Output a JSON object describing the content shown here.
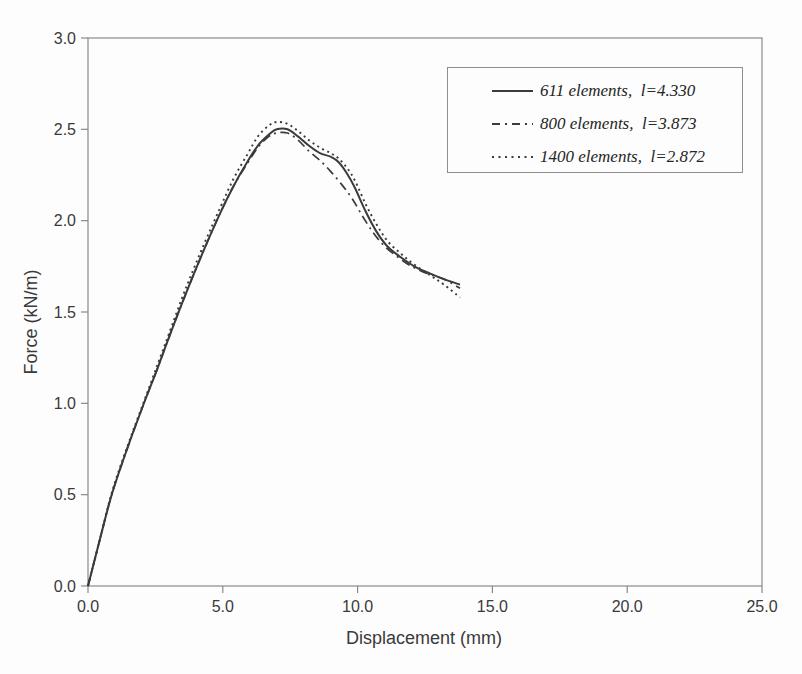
{
  "figure": {
    "background": "#fdfdfd",
    "ink_color": "#3b3b3b",
    "frame_color": "#8a8a8a",
    "text_color": "#3a3a3a"
  },
  "chart_data": {
    "type": "line",
    "title": "",
    "xlabel": "Displacement (mm)",
    "ylabel": "Force (kN/m)",
    "xlim": [
      0,
      25
    ],
    "ylim": [
      0,
      3
    ],
    "x_ticks": [
      0,
      5,
      10,
      15,
      20,
      25
    ],
    "x_tick_labels": [
      "0.0",
      "5.0",
      "10.0",
      "15.0",
      "20.0",
      "25.0"
    ],
    "y_ticks": [
      0,
      0.5,
      1,
      1.5,
      2,
      2.5,
      3
    ],
    "y_tick_labels": [
      "0.0",
      "0.5",
      "1.0",
      "1.5",
      "2.0",
      "2.5",
      "3.0"
    ],
    "grid": false,
    "legend_position": "top-right",
    "series": [
      {
        "name": "611 elements,  l=4.330",
        "line_style": "solid",
        "color": "#3b3b3b",
        "points": [
          [
            0,
            0
          ],
          [
            0.45,
            0.26
          ],
          [
            0.9,
            0.51
          ],
          [
            1.5,
            0.77
          ],
          [
            2.1,
            1.01
          ],
          [
            2.6,
            1.2
          ],
          [
            3.0,
            1.36
          ],
          [
            3.6,
            1.59
          ],
          [
            4.3,
            1.84
          ],
          [
            4.9,
            2.04
          ],
          [
            5.4,
            2.19
          ],
          [
            5.9,
            2.32
          ],
          [
            6.3,
            2.41
          ],
          [
            6.7,
            2.47
          ],
          [
            7.0,
            2.5
          ],
          [
            7.4,
            2.5
          ],
          [
            7.8,
            2.46
          ],
          [
            8.2,
            2.41
          ],
          [
            8.6,
            2.37
          ],
          [
            9.0,
            2.35
          ],
          [
            9.3,
            2.32
          ],
          [
            9.6,
            2.26
          ],
          [
            9.9,
            2.18
          ],
          [
            10.3,
            2.05
          ],
          [
            10.7,
            1.94
          ],
          [
            11.1,
            1.86
          ],
          [
            11.6,
            1.8
          ],
          [
            12.1,
            1.75
          ],
          [
            12.7,
            1.71
          ],
          [
            13.2,
            1.68
          ],
          [
            13.8,
            1.65
          ]
        ]
      },
      {
        "name": "800 elements,  l=3.873",
        "line_style": "dash-dot",
        "color": "#3b3b3b",
        "points": [
          [
            0,
            0
          ],
          [
            0.45,
            0.26
          ],
          [
            0.9,
            0.51
          ],
          [
            1.5,
            0.77
          ],
          [
            2.1,
            1.01
          ],
          [
            2.6,
            1.2
          ],
          [
            3.0,
            1.36
          ],
          [
            3.6,
            1.59
          ],
          [
            4.3,
            1.84
          ],
          [
            4.9,
            2.04
          ],
          [
            5.4,
            2.19
          ],
          [
            5.9,
            2.31
          ],
          [
            6.3,
            2.4
          ],
          [
            6.7,
            2.46
          ],
          [
            7.0,
            2.48
          ],
          [
            7.4,
            2.48
          ],
          [
            7.8,
            2.44
          ],
          [
            8.2,
            2.38
          ],
          [
            8.6,
            2.33
          ],
          [
            9.0,
            2.27
          ],
          [
            9.4,
            2.2
          ],
          [
            9.8,
            2.12
          ],
          [
            10.2,
            2.02
          ],
          [
            10.6,
            1.93
          ],
          [
            11.0,
            1.86
          ],
          [
            11.5,
            1.8
          ],
          [
            12.0,
            1.75
          ],
          [
            12.6,
            1.71
          ],
          [
            13.2,
            1.68
          ],
          [
            13.8,
            1.63
          ]
        ]
      },
      {
        "name": "1400 elements,  l=2.872",
        "line_style": "dotted",
        "color": "#3b3b3b",
        "points": [
          [
            0,
            0
          ],
          [
            0.45,
            0.26
          ],
          [
            0.9,
            0.52
          ],
          [
            1.5,
            0.78
          ],
          [
            2.1,
            1.02
          ],
          [
            2.6,
            1.22
          ],
          [
            3.0,
            1.38
          ],
          [
            3.6,
            1.62
          ],
          [
            4.3,
            1.87
          ],
          [
            4.9,
            2.07
          ],
          [
            5.4,
            2.23
          ],
          [
            5.9,
            2.36
          ],
          [
            6.3,
            2.46
          ],
          [
            6.7,
            2.52
          ],
          [
            7.0,
            2.54
          ],
          [
            7.4,
            2.53
          ],
          [
            7.8,
            2.49
          ],
          [
            8.2,
            2.44
          ],
          [
            8.6,
            2.4
          ],
          [
            9.0,
            2.37
          ],
          [
            9.3,
            2.34
          ],
          [
            9.6,
            2.29
          ],
          [
            9.9,
            2.22
          ],
          [
            10.3,
            2.09
          ],
          [
            10.7,
            1.98
          ],
          [
            11.1,
            1.89
          ],
          [
            11.6,
            1.82
          ],
          [
            12.1,
            1.76
          ],
          [
            12.7,
            1.7
          ],
          [
            13.2,
            1.65
          ],
          [
            13.8,
            1.58
          ]
        ]
      }
    ]
  },
  "legend": {
    "items": [
      {
        "label": "611 elements,  l=4.330",
        "line_style": "solid"
      },
      {
        "label": "800 elements,  l=3.873",
        "line_style": "dash-dot"
      },
      {
        "label": "1400 elements,  l=2.872",
        "line_style": "dotted"
      }
    ]
  }
}
